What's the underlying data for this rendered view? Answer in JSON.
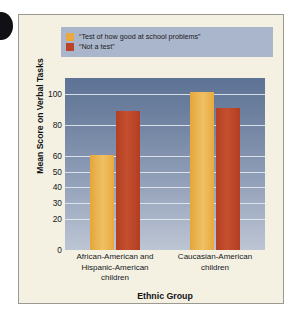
{
  "figure": {
    "panel_background": "#f4f1e2",
    "edge_tab_color": "#111014"
  },
  "chart_data": {
    "type": "bar",
    "title": "",
    "xlabel": "Ethnic Group",
    "ylabel": "Mean Score on Verbal Tasks",
    "categories": [
      "African-American and Hispanic-American children",
      "Caucasian-American children"
    ],
    "category_lines": [
      [
        "African-American and",
        "Hispanic-American",
        "children"
      ],
      [
        "Caucasian-American",
        "children"
      ]
    ],
    "series": [
      {
        "name": "“Test of how good at school problems”",
        "color": "#e9a93e",
        "values": [
          61,
          101
        ]
      },
      {
        "name": "“Not a test”",
        "color": "#b9442a",
        "values": [
          89,
          91
        ]
      }
    ],
    "ylim": [
      0,
      110
    ],
    "yticks": [
      0,
      20,
      30,
      40,
      50,
      60,
      80,
      100
    ],
    "ytick_labels": [
      "0",
      "20",
      "30",
      "40",
      "50",
      "60",
      "80",
      "100"
    ],
    "grid": true,
    "legend_position": "above-plot",
    "plot_background_top": "#5d7395",
    "plot_background_bottom": "#bcc5d4",
    "gridline_color": "#e8edf4"
  }
}
